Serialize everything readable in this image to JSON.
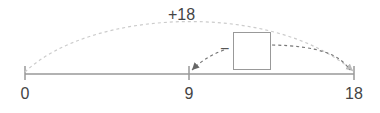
{
  "number_line": {
    "ticks": [
      {
        "value": "0",
        "x": 25
      },
      {
        "value": "9",
        "x": 189
      },
      {
        "value": "18",
        "x": 354
      }
    ],
    "line_color": "#999999"
  },
  "jumps": {
    "big_jump_label": "+18",
    "small_jump_operator": "−",
    "arc_color": "#cccccc",
    "small_arrow_color": "#888888"
  },
  "answer_box": {
    "value": ""
  }
}
